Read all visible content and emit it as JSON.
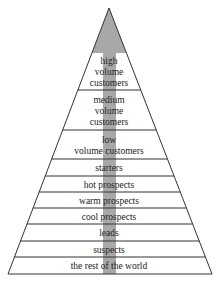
{
  "diagram": {
    "title": "",
    "apex": {
      "x": 109,
      "y": 8
    },
    "base": {
      "left": 8,
      "right": 212,
      "y": 274
    },
    "shade_color": "#a8a8a8",
    "line_color": "#333333",
    "shaded_apex_bottom_y": 53,
    "bar": {
      "x1": 103,
      "x2": 116
    },
    "tiers": [
      {
        "name": "high-volume-customers",
        "lines": [
          "high",
          "volume",
          "customers"
        ],
        "top": 53,
        "bottom": 90
      },
      {
        "name": "medium-volume-customers",
        "lines": [
          "medium",
          "volume",
          "customers"
        ],
        "top": 90,
        "bottom": 130
      },
      {
        "name": "low-volume-customers",
        "lines": [
          "low",
          "volume customers"
        ],
        "top": 130,
        "bottom": 159
      },
      {
        "name": "starters",
        "lines": [
          "starters"
        ],
        "top": 159,
        "bottom": 176
      },
      {
        "name": "hot-prospects",
        "lines": [
          "hot prospects"
        ],
        "top": 176,
        "bottom": 192
      },
      {
        "name": "warm-prospects",
        "lines": [
          "warm prospects"
        ],
        "top": 192,
        "bottom": 208
      },
      {
        "name": "cool-prospects",
        "lines": [
          "cool prospects"
        ],
        "top": 208,
        "bottom": 224
      },
      {
        "name": "leads",
        "lines": [
          "leads"
        ],
        "top": 224,
        "bottom": 241
      },
      {
        "name": "suspects",
        "lines": [
          "suspects"
        ],
        "top": 241,
        "bottom": 257
      },
      {
        "name": "the-rest-of-the-world",
        "lines": [
          "the rest of the world"
        ],
        "top": 257,
        "bottom": 274
      }
    ]
  }
}
